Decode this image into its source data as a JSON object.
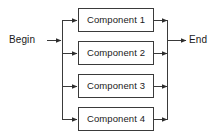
{
  "diagram": {
    "type": "block-flow-parallel",
    "background_color": "#ffffff",
    "line_color": "#3a3a3a",
    "text_color": "#1a1a1a",
    "start": {
      "label": "Begin",
      "x": 9,
      "y": 35
    },
    "end": {
      "label": "End",
      "x": 189,
      "y": 35
    },
    "split_bus": {
      "name": "left-split-bus",
      "x": 62,
      "y_top": 20,
      "y_bottom": 119
    },
    "merge_bus": {
      "name": "right-merge-bus",
      "x": 167,
      "y_top": 20,
      "y_bottom": 119
    },
    "nodes": [
      {
        "id": 1,
        "label": "Component 1",
        "x": 78,
        "y": 8,
        "width": 76,
        "height": 24
      },
      {
        "id": 2,
        "label": "Component 2",
        "x": 78,
        "y": 41,
        "width": 76,
        "height": 24
      },
      {
        "id": 3,
        "label": "Component 3",
        "x": 78,
        "y": 74,
        "width": 76,
        "height": 24
      },
      {
        "id": 4,
        "label": "Component 4",
        "x": 78,
        "y": 107,
        "width": 76,
        "height": 24
      }
    ],
    "edges": [
      {
        "name": "begin-to-split",
        "from": "Begin",
        "to": "left-split-bus"
      },
      {
        "name": "split-to-comp-1",
        "from": "left-split-bus",
        "to": "Component 1"
      },
      {
        "name": "split-to-comp-2",
        "from": "left-split-bus",
        "to": "Component 2"
      },
      {
        "name": "split-to-comp-3",
        "from": "left-split-bus",
        "to": "Component 3"
      },
      {
        "name": "split-to-comp-4",
        "from": "left-split-bus",
        "to": "Component 4"
      },
      {
        "name": "comp-1-to-merge",
        "from": "Component 1",
        "to": "right-merge-bus"
      },
      {
        "name": "comp-2-to-merge",
        "from": "Component 2",
        "to": "right-merge-bus"
      },
      {
        "name": "comp-3-to-merge",
        "from": "Component 3",
        "to": "right-merge-bus"
      },
      {
        "name": "comp-4-to-merge",
        "from": "Component 4",
        "to": "right-merge-bus"
      },
      {
        "name": "merge-to-end",
        "from": "right-merge-bus",
        "to": "End"
      }
    ]
  }
}
